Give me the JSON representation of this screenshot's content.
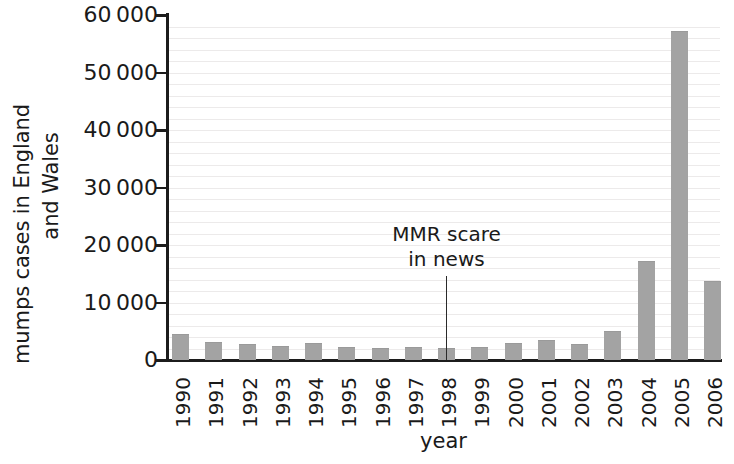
{
  "chart_data": {
    "type": "bar",
    "title": "",
    "xlabel": "year",
    "ylabel": "mumps cases in England and Wales",
    "ylabel_line1": "mumps cases in England",
    "ylabel_line2": "and Wales",
    "categories": [
      "1990",
      "1991",
      "1992",
      "1993",
      "1994",
      "1995",
      "1996",
      "1997",
      "1998",
      "1999",
      "2000",
      "2001",
      "2002",
      "2003",
      "2004",
      "2005",
      "2006"
    ],
    "values": [
      4500,
      3200,
      2700,
      2500,
      3000,
      2200,
      2100,
      2200,
      2100,
      2200,
      2900,
      3500,
      2800,
      5000,
      17200,
      57200,
      13800
    ],
    "ylim": [
      0,
      60000
    ],
    "ytick_values": [
      0,
      10000,
      20000,
      30000,
      40000,
      50000,
      60000
    ],
    "ytick_labels": [
      "0",
      "10 000",
      "20 000",
      "30 000",
      "40 000",
      "50 000",
      "60 000"
    ],
    "grid": true,
    "grid_minor_step": 2000,
    "legend": "none",
    "bar_color": "#a3a3a3",
    "axis_color": "#1c1c1c",
    "annotations": [
      {
        "text": "MMR scare in news",
        "line1": "MMR scare",
        "line2": "in news",
        "points_to_category": "1998"
      }
    ]
  },
  "caption": {
    "cropped_text": ""
  }
}
